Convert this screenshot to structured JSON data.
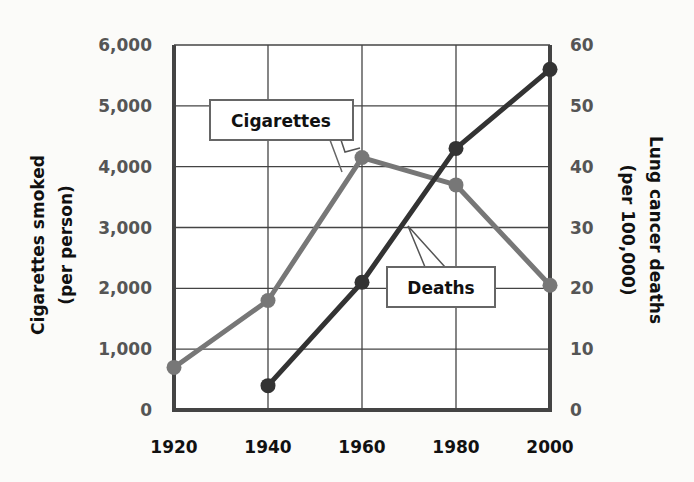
{
  "chart_data": {
    "type": "line",
    "title": "",
    "x": [
      1920,
      1940,
      1960,
      1980,
      2000
    ],
    "xlabel": "",
    "x_tick_labels": [
      "1920",
      "1940",
      "1960",
      "1980",
      "2000"
    ],
    "series": [
      {
        "name": "Cigarettes",
        "axis": "left",
        "color": "#777777",
        "values": [
          700,
          1800,
          4150,
          3700,
          2050
        ]
      },
      {
        "name": "Deaths",
        "axis": "right",
        "color": "#333333",
        "values": [
          null,
          4,
          21,
          43,
          56
        ]
      }
    ],
    "ylabel_left": "Cigarettes smoked (per person)",
    "ylabel_left_line1": "Cigarettes smoked",
    "ylabel_left_line2": "(per person)",
    "ylim_left": [
      0,
      6000
    ],
    "yticks_left": [
      "0",
      "1,000",
      "2,000",
      "3,000",
      "4,000",
      "5,000",
      "6,000"
    ],
    "ylabel_right": "Lung cancer deaths (per 100,000)",
    "ylabel_right_line1": "Lung cancer deaths",
    "ylabel_right_line2": "(per 100,000)",
    "ylim_right": [
      0,
      60
    ],
    "yticks_right": [
      "0",
      "10",
      "20",
      "30",
      "40",
      "50",
      "60"
    ],
    "annotations": [
      "Cigarettes",
      "Deaths"
    ],
    "grid": true,
    "legend": "callout labels"
  }
}
